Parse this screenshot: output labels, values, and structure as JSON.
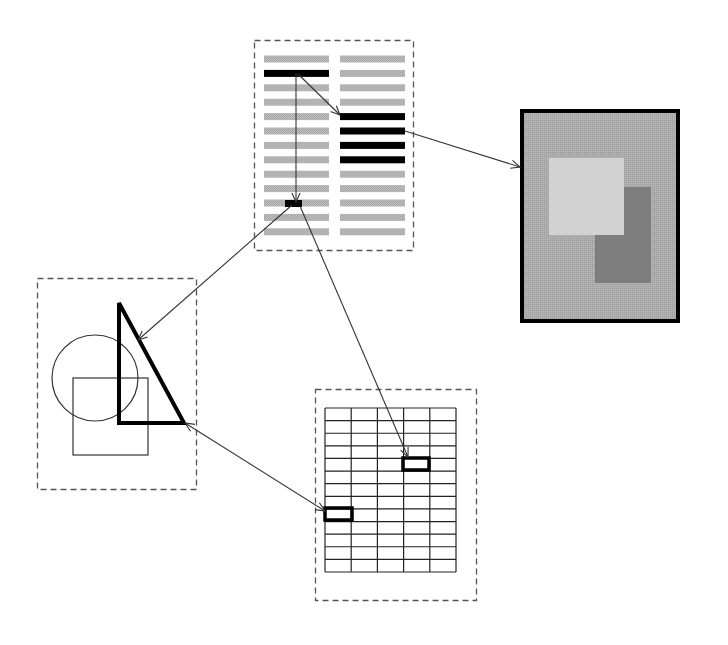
{
  "diagram": {
    "background": "#ffffff",
    "colors": {
      "dashed_frame": "#555555",
      "text_line": "#b4b4b4",
      "highlight": "#000000",
      "arrow": "#333333",
      "image_bg": "#a9a9a9",
      "image_light": "#d2d2d2",
      "image_dark": "#7e7e7e"
    },
    "document_panel": {
      "frame": {
        "x": 254,
        "y": 40,
        "w": 159,
        "h": 210
      },
      "columns": [
        {
          "x": 264,
          "w": 65
        },
        {
          "x": 340,
          "w": 65
        }
      ],
      "line_count": 13,
      "first_line_y": 59,
      "line_spacing": 14.4,
      "line_height": 7,
      "highlighted_left_lines": [
        1
      ],
      "highlighted_right_lines": [
        4,
        5,
        6,
        7
      ],
      "small_mark": {
        "x": 285,
        "y": 200,
        "w": 17,
        "h": 7
      }
    },
    "image_panel": {
      "frame": {
        "x": 520,
        "y": 109,
        "w": 160,
        "h": 214
      },
      "light_rect": {
        "x": 549,
        "y": 158,
        "w": 75,
        "h": 77
      },
      "dark_rect": {
        "x": 595,
        "y": 187,
        "w": 56,
        "h": 96
      }
    },
    "shapes_panel": {
      "frame": {
        "x": 37,
        "y": 278,
        "w": 159,
        "h": 211
      },
      "circle": {
        "cx": 95,
        "cy": 378,
        "r": 43
      },
      "square": {
        "x": 73,
        "y": 378,
        "w": 75,
        "h": 77
      },
      "triangle": {
        "points": "119,303 119,423 184,423"
      }
    },
    "table_panel": {
      "frame": {
        "x": 315,
        "y": 389,
        "w": 161,
        "h": 211
      },
      "grid": {
        "x": 325,
        "y": 408,
        "w": 131,
        "h": 164,
        "cols": 5,
        "rows": 13
      },
      "highlighted_cells": [
        {
          "x": 403,
          "y": 458,
          "w": 26,
          "h": 12
        },
        {
          "x": 325,
          "y": 508,
          "w": 27,
          "h": 12
        }
      ]
    },
    "arrows": [
      {
        "id": "bar-to-mark",
        "x1": 296,
        "y1": 73,
        "x2": 296,
        "y2": 202,
        "head_end": true,
        "head_start": false
      },
      {
        "id": "bar-to-right-lines",
        "x1": 298,
        "y1": 74,
        "x2": 340,
        "y2": 115,
        "head_end": true,
        "head_start": false
      },
      {
        "id": "lines-to-image",
        "x1": 405,
        "y1": 131,
        "x2": 520,
        "y2": 167,
        "head_end": true,
        "head_start": false
      },
      {
        "id": "mark-to-triangle",
        "x1": 292,
        "y1": 205,
        "x2": 138,
        "y2": 340,
        "head_end": true,
        "head_start": false
      },
      {
        "id": "mark-to-table-cell",
        "x1": 300,
        "y1": 206,
        "x2": 408,
        "y2": 457,
        "head_end": true,
        "head_start": false
      },
      {
        "id": "triangle-to-table-cell",
        "x1": 185,
        "y1": 423,
        "x2": 325,
        "y2": 511,
        "head_end": true,
        "head_start": true
      }
    ]
  }
}
